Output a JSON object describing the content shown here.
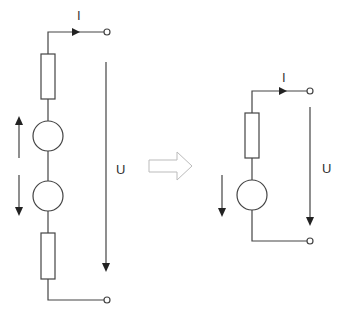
{
  "diagram": {
    "type": "circuit-equivalence",
    "left_circuit": {
      "current_label": "I",
      "voltage_label": "U",
      "components": [
        "resistor",
        "source",
        "source",
        "resistor"
      ]
    },
    "transform_arrow": "hollow-right-arrow",
    "right_circuit": {
      "current_label": "I",
      "voltage_label": "U",
      "components": [
        "resistor",
        "source"
      ]
    },
    "colors": {
      "stroke": "#444444",
      "hollow_arrow": "#bbbbbb",
      "background": "#ffffff"
    }
  }
}
